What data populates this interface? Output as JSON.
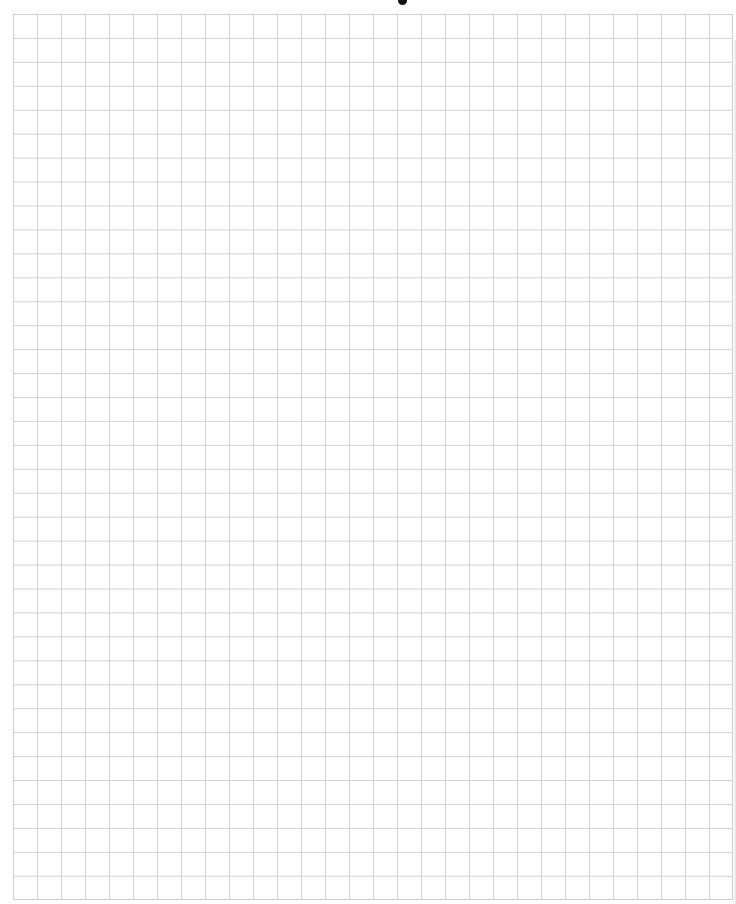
{
  "page": {
    "type": "graph-paper",
    "title_visible_fragment": "",
    "grid": {
      "columns": 30,
      "rows": 37,
      "cell_width_px": 24,
      "cell_height_px": 24,
      "line_color": "#d2d2d2",
      "border_color": "#cfcfcf",
      "background_color": "#ffffff"
    }
  }
}
